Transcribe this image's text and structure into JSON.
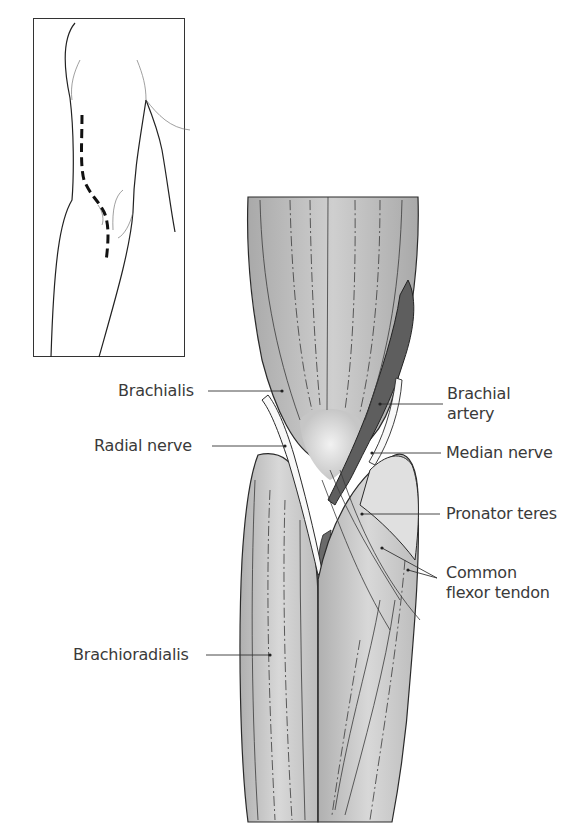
{
  "figure": {
    "type": "anatomical illustration",
    "inset": {
      "description": "arm outline with dashed incision line",
      "incision_style": "dashed"
    },
    "labels": {
      "brachialis": "Brachialis",
      "radial_nerve": "Radial nerve",
      "brachioradialis": "Brachioradialis",
      "brachial_artery_line1": "Brachial",
      "brachial_artery_line2": "artery",
      "median_nerve": "Median nerve",
      "pronator_teres": "Pronator teres",
      "common_flexor_line1": "Common",
      "common_flexor_line2": "flexor tendon"
    },
    "colors": {
      "muscle": "#b9b9b9",
      "muscle_light": "#d6d6d6",
      "tendon": "#ececec",
      "artery": "#5e5e5e",
      "outline": "#2a2a2a",
      "text": "#3a3a3a"
    }
  }
}
